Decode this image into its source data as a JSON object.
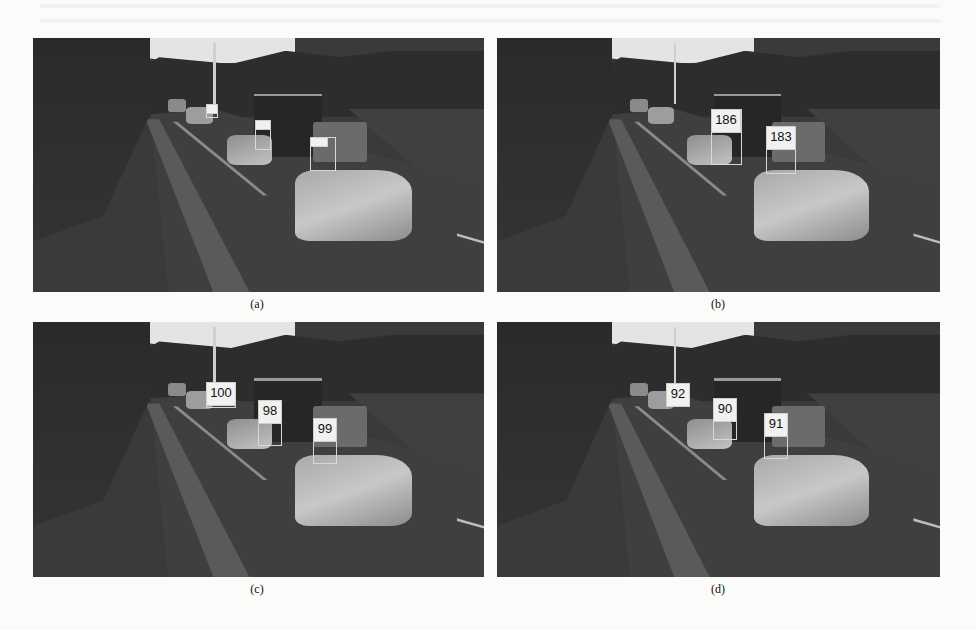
{
  "figure": {
    "panels": [
      {
        "id": "a",
        "caption": "(a)",
        "tracks": [
          {
            "label": "",
            "x": 173,
            "y": 66,
            "w": 10,
            "h": 8
          },
          {
            "label": "",
            "x": 222,
            "y": 82,
            "w": 14,
            "h": 28
          },
          {
            "label": "",
            "x": 277,
            "y": 99,
            "w": 24,
            "h": 32
          }
        ]
      },
      {
        "id": "b",
        "caption": "(b)",
        "tracks": [
          {
            "label": "186",
            "x": 214,
            "y": 71,
            "w": 29,
            "h": 54
          },
          {
            "label": "183",
            "x": 269,
            "y": 88,
            "w": 28,
            "h": 46
          }
        ]
      },
      {
        "id": "c",
        "caption": "(c)",
        "tracks": [
          {
            "label": "100",
            "x": 173,
            "y": 60,
            "w": 28,
            "h": 24
          },
          {
            "label": "98",
            "x": 225,
            "y": 78,
            "w": 22,
            "h": 44
          },
          {
            "label": "99",
            "x": 280,
            "y": 96,
            "w": 22,
            "h": 44
          }
        ]
      },
      {
        "id": "d",
        "caption": "(d)",
        "tracks": [
          {
            "label": "92",
            "x": 169,
            "y": 61,
            "w": 22,
            "h": 22
          },
          {
            "label": "90",
            "x": 216,
            "y": 76,
            "w": 22,
            "h": 40
          },
          {
            "label": "91",
            "x": 267,
            "y": 91,
            "w": 22,
            "h": 44
          }
        ]
      }
    ]
  }
}
